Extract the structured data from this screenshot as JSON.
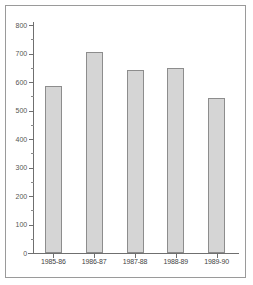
{
  "chart_data": {
    "type": "bar",
    "title": "",
    "subtitle": "",
    "xlabel": "",
    "ylabel": "",
    "categories": [
      "1985-86",
      "1986-87",
      "1987-88",
      "1988-89",
      "1989-90"
    ],
    "values": [
      585,
      705,
      642,
      649,
      544
    ],
    "series": [
      {
        "name": "",
        "values": [
          585,
          705,
          642,
          649,
          544
        ]
      }
    ],
    "ylim": [
      0,
      800
    ],
    "ytick_labels": [
      "0",
      "100",
      "200",
      "300",
      "400",
      "500",
      "600",
      "700",
      "800"
    ],
    "ytick_values": [
      0,
      100,
      200,
      300,
      400,
      500,
      600,
      700,
      800
    ],
    "yminor_tick_values": [
      50,
      150,
      250,
      350,
      450,
      550,
      650,
      750
    ],
    "grid": false,
    "legend": false,
    "legend_position": "none",
    "annotations": [],
    "colors": {
      "bar_fill": "#d5d5d5",
      "bar_border": "#8d8d8d",
      "axis": "#6f6f6f",
      "tick_label": "#555555",
      "frame": "#9a9a9a",
      "background": "#ffffff"
    }
  }
}
